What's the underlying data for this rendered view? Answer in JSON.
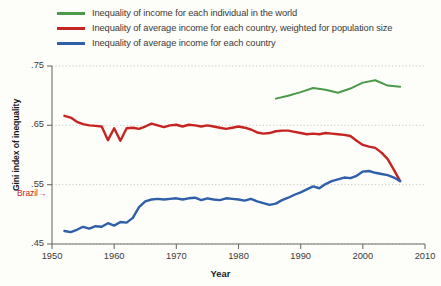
{
  "chart_data": {
    "type": "line",
    "title": "",
    "xlabel": "Year",
    "ylabel": "Gini index of inequality",
    "xlim": [
      1950,
      2010
    ],
    "ylim": [
      0.45,
      0.75
    ],
    "xticks": [
      1950,
      1960,
      1970,
      1980,
      1990,
      2000,
      2010
    ],
    "xtick_labels": [
      "1950",
      "1960",
      "1970",
      "1980",
      "1990",
      "2000",
      "2010"
    ],
    "yticks": [
      0.45,
      0.55,
      0.65,
      0.75
    ],
    "ytick_labels": [
      ".45",
      ".55",
      ".65",
      ".75"
    ],
    "grid": "horizontal-dotted",
    "legend_position": "top",
    "annotations": [
      {
        "text": "Brazil",
        "arrow": "→",
        "value": 0.535,
        "color": "#c62420"
      }
    ],
    "series": [
      {
        "name": "Inequality of income for each individual in the world",
        "color": "#4a9a4a",
        "x": [
          1986,
          1988,
          1990,
          1992,
          1994,
          1996,
          1998,
          2000,
          2002,
          2004,
          2006
        ],
        "values": [
          0.695,
          0.7,
          0.706,
          0.713,
          0.71,
          0.705,
          0.712,
          0.722,
          0.726,
          0.717,
          0.715
        ]
      },
      {
        "name": "Inequality of average income for each country, weighted for population size",
        "color": "#c62420",
        "x": [
          1952,
          1953,
          1954,
          1955,
          1956,
          1957,
          1958,
          1959,
          1960,
          1961,
          1962,
          1963,
          1964,
          1965,
          1966,
          1967,
          1968,
          1969,
          1970,
          1971,
          1972,
          1973,
          1974,
          1975,
          1976,
          1977,
          1978,
          1979,
          1980,
          1981,
          1982,
          1983,
          1984,
          1985,
          1986,
          1987,
          1988,
          1989,
          1990,
          1991,
          1992,
          1993,
          1994,
          1995,
          1996,
          1997,
          1998,
          1999,
          2000,
          2001,
          2002,
          2003,
          2004,
          2005,
          2006
        ],
        "values": [
          0.666,
          0.663,
          0.656,
          0.652,
          0.65,
          0.649,
          0.648,
          0.625,
          0.645,
          0.624,
          0.645,
          0.646,
          0.644,
          0.648,
          0.653,
          0.65,
          0.647,
          0.65,
          0.651,
          0.648,
          0.651,
          0.65,
          0.648,
          0.65,
          0.648,
          0.646,
          0.644,
          0.646,
          0.648,
          0.646,
          0.643,
          0.638,
          0.636,
          0.637,
          0.64,
          0.641,
          0.641,
          0.639,
          0.637,
          0.635,
          0.636,
          0.635,
          0.637,
          0.636,
          0.635,
          0.634,
          0.632,
          0.624,
          0.617,
          0.614,
          0.612,
          0.604,
          0.593,
          0.575,
          0.556
        ]
      },
      {
        "name": "Inequality of average income for each country",
        "color": "#2f5fa8",
        "x": [
          1952,
          1953,
          1954,
          1955,
          1956,
          1957,
          1958,
          1959,
          1960,
          1961,
          1962,
          1963,
          1964,
          1965,
          1966,
          1967,
          1968,
          1969,
          1970,
          1971,
          1972,
          1973,
          1974,
          1975,
          1976,
          1977,
          1978,
          1979,
          1980,
          1981,
          1982,
          1983,
          1984,
          1985,
          1986,
          1987,
          1988,
          1989,
          1990,
          1991,
          1992,
          1993,
          1994,
          1995,
          1996,
          1997,
          1998,
          1999,
          2000,
          2001,
          2002,
          2003,
          2004,
          2005,
          2006
        ],
        "values": [
          0.472,
          0.47,
          0.474,
          0.479,
          0.476,
          0.48,
          0.479,
          0.485,
          0.481,
          0.487,
          0.486,
          0.494,
          0.512,
          0.522,
          0.525,
          0.526,
          0.525,
          0.526,
          0.527,
          0.525,
          0.527,
          0.528,
          0.524,
          0.527,
          0.525,
          0.524,
          0.527,
          0.526,
          0.525,
          0.523,
          0.526,
          0.522,
          0.519,
          0.516,
          0.518,
          0.524,
          0.528,
          0.533,
          0.537,
          0.542,
          0.547,
          0.544,
          0.551,
          0.556,
          0.559,
          0.562,
          0.561,
          0.565,
          0.572,
          0.573,
          0.57,
          0.568,
          0.566,
          0.562,
          0.556
        ]
      }
    ]
  },
  "legend": {
    "items": [
      {
        "label": "Inequality of income for each individual in the world"
      },
      {
        "label": "Inequality of average income for each country, weighted for population size"
      },
      {
        "label": "Inequality of average income for each country"
      }
    ]
  }
}
